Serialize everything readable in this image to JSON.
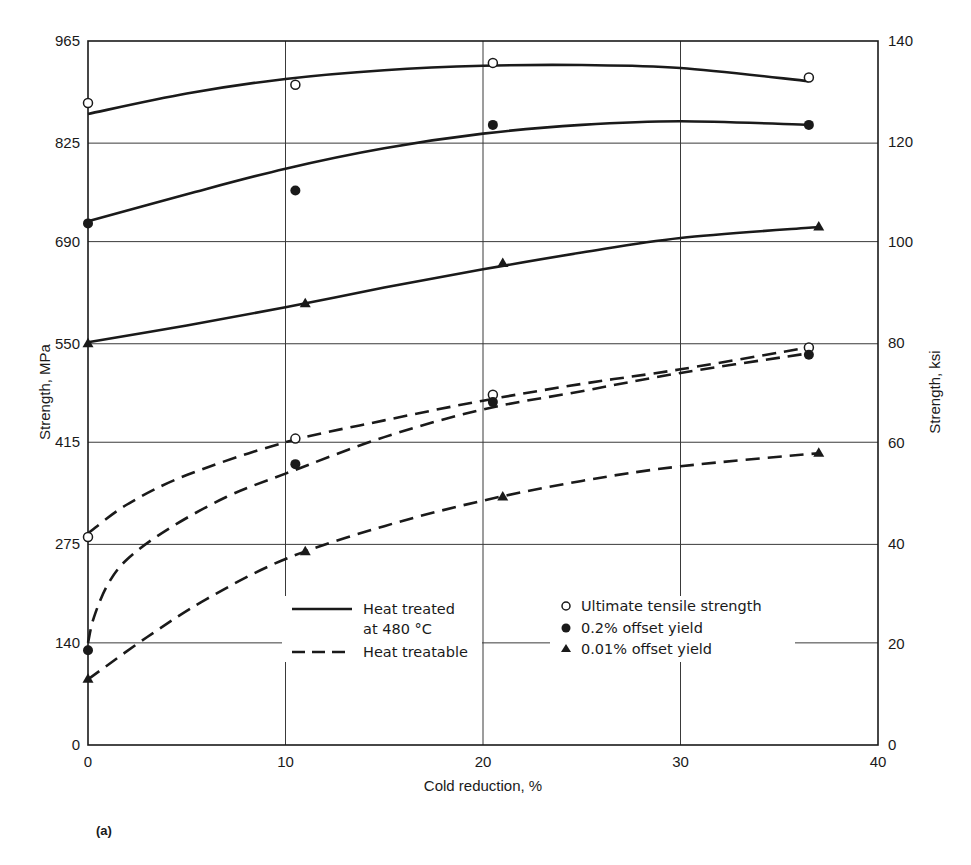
{
  "chart_data": {
    "type": "line",
    "caption": "(a)",
    "xlabel": "Cold reduction, %",
    "ylabel_left": "Strength, MPa",
    "ylabel_right": "Strength, ksi",
    "xlim": [
      0,
      40
    ],
    "ylim_left": [
      0,
      965
    ],
    "ylim_right": [
      0,
      140
    ],
    "x_ticks": [
      "0",
      "10",
      "20",
      "30",
      "40"
    ],
    "y_ticks_left": [
      "0",
      "140",
      "275",
      "415",
      "550",
      "690",
      "825",
      "965"
    ],
    "y_ticks_right": [
      "0",
      "20",
      "40",
      "60",
      "80",
      "100",
      "120",
      "140"
    ],
    "grid": true,
    "legend": {
      "line_styles": [
        {
          "style": "solid",
          "label_line1": "Heat treated",
          "label_line2": "at 480 °C"
        },
        {
          "style": "dashed",
          "label_line1": "Heat treatable"
        }
      ],
      "markers": [
        {
          "marker": "open-circle",
          "label": "Ultimate tensile strength"
        },
        {
          "marker": "filled-circle",
          "label": "0.2% offset yield"
        },
        {
          "marker": "filled-triangle",
          "label": "0.01% offset yield"
        }
      ]
    },
    "series": [
      {
        "name": "Ultimate tensile strength — Heat treated at 480 °C",
        "style": "solid",
        "marker": "open-circle",
        "x": [
          0,
          10.5,
          20.5,
          36.5
        ],
        "values": [
          880,
          905,
          935,
          915
        ]
      },
      {
        "name": "0.2% offset yield — Heat treated at 480 °C",
        "style": "solid",
        "marker": "filled-circle",
        "x": [
          0,
          10.5,
          20.5,
          36.5
        ],
        "values": [
          715,
          760,
          850,
          850
        ]
      },
      {
        "name": "0.01% offset yield — Heat treated at 480 °C",
        "style": "solid",
        "marker": "filled-triangle",
        "x": [
          0,
          11,
          21,
          37
        ],
        "values": [
          550,
          605,
          660,
          710
        ]
      },
      {
        "name": "Ultimate tensile strength — Heat treatable",
        "style": "dashed",
        "marker": "open-circle",
        "x": [
          0,
          10.5,
          20.5,
          36.5
        ],
        "values": [
          285,
          420,
          480,
          545
        ]
      },
      {
        "name": "0.2% offset yield — Heat treatable",
        "style": "dashed",
        "marker": "filled-circle",
        "x": [
          0,
          10.5,
          20.5,
          36.5
        ],
        "values": [
          130,
          385,
          470,
          535
        ]
      },
      {
        "name": "0.01% offset yield — Heat treatable",
        "style": "dashed",
        "marker": "filled-triangle",
        "x": [
          0,
          11,
          21,
          37
        ],
        "values": [
          90,
          265,
          340,
          400
        ]
      }
    ],
    "fit_curves": [
      {
        "series": 0,
        "style": "solid",
        "x": [
          0,
          5,
          10,
          15,
          20,
          25,
          30,
          36.5
        ],
        "y": [
          865,
          893,
          913,
          925,
          931,
          932,
          928,
          910
        ]
      },
      {
        "series": 1,
        "style": "solid",
        "x": [
          0,
          5,
          10,
          15,
          20,
          25,
          30,
          36.5
        ],
        "y": [
          718,
          755,
          790,
          818,
          838,
          850,
          855,
          850
        ]
      },
      {
        "series": 2,
        "style": "solid",
        "x": [
          0,
          5,
          10,
          15,
          20,
          25,
          30,
          37
        ],
        "y": [
          552,
          575,
          600,
          627,
          652,
          675,
          695,
          710
        ]
      },
      {
        "series": 3,
        "style": "dashed",
        "x": [
          0,
          2,
          5,
          10,
          15,
          20,
          25,
          30,
          36.5
        ],
        "y": [
          290,
          330,
          370,
          415,
          445,
          472,
          495,
          515,
          545
        ]
      },
      {
        "series": 4,
        "style": "dashed",
        "x": [
          0,
          0.3,
          1,
          2,
          4,
          7,
          10,
          15,
          20,
          25,
          30,
          36.5
        ],
        "y": [
          140,
          175,
          220,
          255,
          295,
          340,
          372,
          422,
          460,
          485,
          510,
          537
        ]
      },
      {
        "series": 5,
        "style": "dashed",
        "x": [
          0,
          3,
          6,
          10,
          15,
          20,
          25,
          30,
          37
        ],
        "y": [
          90,
          148,
          200,
          255,
          300,
          335,
          362,
          382,
          400
        ]
      }
    ]
  },
  "colors": {
    "ink": "#1a1a1a",
    "grid": "#3a3a3a",
    "background": "#ffffff"
  }
}
